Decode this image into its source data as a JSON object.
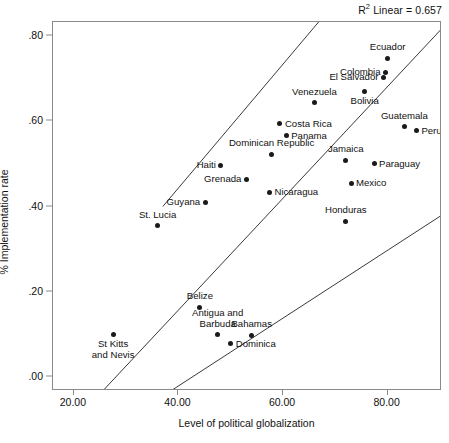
{
  "annotation": {
    "r2_prefix": "R",
    "r2_exponent": "2",
    "r2_text": " Linear = 0.657"
  },
  "axes": {
    "xlabel": "Level of political globalization",
    "ylabel": "% Implementation rate",
    "xticks": [
      "20.00",
      "40.00",
      "60.00",
      "80.00"
    ],
    "xtick_values": [
      20,
      40,
      60,
      80
    ],
    "yticks": [
      ".00",
      ".20",
      ".40",
      ".60",
      ".80"
    ],
    "ytick_values": [
      0.0,
      0.2,
      0.4,
      0.6,
      0.8
    ],
    "xlim": [
      16.0,
      90.4
    ],
    "ylim": [
      -0.033,
      0.833
    ]
  },
  "chart_data": {
    "type": "scatter",
    "title": "",
    "xlabel": "Level of political globalization",
    "ylabel": "% Implementation rate",
    "xlim": [
      16.0,
      90.4
    ],
    "ylim": [
      -0.033,
      0.833
    ],
    "grid": false,
    "legend": null,
    "r_squared": 0.657,
    "fit_label": "R2 Linear = 0.657",
    "point_labels_shown": true,
    "points": [
      {
        "label": "Ecuador",
        "x": 80.0,
        "y": 0.748,
        "label_pos": "top"
      },
      {
        "label": "Colombia",
        "x": 79.6,
        "y": 0.715,
        "label_pos": "left"
      },
      {
        "label": "El Salvador",
        "x": 79.2,
        "y": 0.703,
        "label_pos": "left"
      },
      {
        "label": "Bolivia",
        "x": 75.6,
        "y": 0.67,
        "label_pos": "bottom"
      },
      {
        "label": "Venezuela",
        "x": 66.0,
        "y": 0.644,
        "label_pos": "top"
      },
      {
        "label": "Guatemala",
        "x": 83.2,
        "y": 0.587,
        "label_pos": "top"
      },
      {
        "label": "Peru",
        "x": 85.5,
        "y": 0.578,
        "label_pos": "right"
      },
      {
        "label": "Costa Rica",
        "x": 59.4,
        "y": 0.594,
        "label_pos": "right"
      },
      {
        "label": "Panama",
        "x": 60.6,
        "y": 0.566,
        "label_pos": "right"
      },
      {
        "label": "Dominican Republic",
        "x": 57.8,
        "y": 0.523,
        "label_pos": "top"
      },
      {
        "label": "Jamaica",
        "x": 72.0,
        "y": 0.509,
        "label_pos": "top"
      },
      {
        "label": "Paraguay",
        "x": 77.4,
        "y": 0.5,
        "label_pos": "right"
      },
      {
        "label": "Haiti",
        "x": 48.1,
        "y": 0.497,
        "label_pos": "left"
      },
      {
        "label": "Grenada",
        "x": 53.0,
        "y": 0.464,
        "label_pos": "left"
      },
      {
        "label": "Mexico",
        "x": 73.0,
        "y": 0.455,
        "label_pos": "right"
      },
      {
        "label": "Nicaragua",
        "x": 57.4,
        "y": 0.434,
        "label_pos": "right"
      },
      {
        "label": "Guyana",
        "x": 45.1,
        "y": 0.41,
        "label_pos": "left"
      },
      {
        "label": "Honduras",
        "x": 72.0,
        "y": 0.365,
        "label_pos": "top"
      },
      {
        "label": "St. Lucia",
        "x": 36.0,
        "y": 0.355,
        "label_pos": "top"
      },
      {
        "label": "Belize",
        "x": 44.1,
        "y": 0.163,
        "label_pos": "top"
      },
      {
        "label": "Antigua and\nBarbuda",
        "x": 47.5,
        "y": 0.1,
        "label_pos": "top"
      },
      {
        "label": "Bahamas",
        "x": 54.0,
        "y": 0.098,
        "label_pos": "top"
      },
      {
        "label": "St Kitts\nand Nevis",
        "x": 27.5,
        "y": 0.1,
        "label_pos": "bottom"
      },
      {
        "label": "Dominica",
        "x": 50.0,
        "y": 0.078,
        "label_pos": "right"
      }
    ],
    "fit_lines": [
      {
        "name": "upper-band",
        "x1": 37.0,
        "y1": 0.4,
        "x2": 66.8,
        "y2": 0.833
      },
      {
        "name": "regression",
        "x1": 25.5,
        "y1": -0.033,
        "x2": 90.4,
        "y2": 0.818
      },
      {
        "name": "lower-band",
        "x1": 38.5,
        "y1": -0.033,
        "x2": 90.4,
        "y2": 0.38
      }
    ]
  },
  "colors": {
    "point": "#1a1a1a",
    "frame": "#8a8a8a",
    "line": "#3a3a3a",
    "text": "#111111",
    "background": "#ffffff"
  }
}
